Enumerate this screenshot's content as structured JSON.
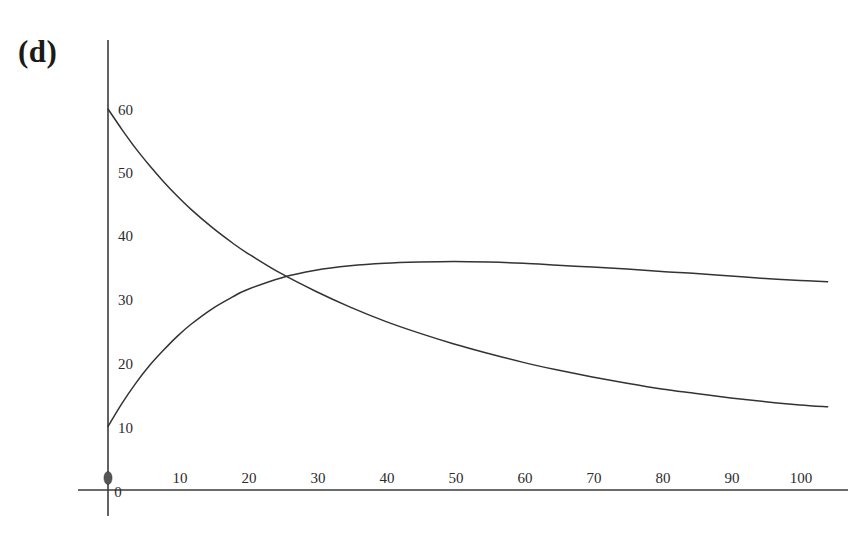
{
  "figure": {
    "panel_label": "(d)",
    "background_color": "#ffffff",
    "axis_color": "#3b3b3b",
    "curve_color": "#333333"
  },
  "chart_data": {
    "type": "line",
    "title": "",
    "subtitle": "",
    "xlabel": "",
    "ylabel": "",
    "panel_label": "(d)",
    "xlim": [
      0,
      104
    ],
    "ylim": [
      0,
      66
    ],
    "grid": false,
    "legend": null,
    "xticks": [
      0,
      10,
      20,
      30,
      40,
      50,
      60,
      70,
      80,
      90,
      100
    ],
    "xtick_labels": [
      "0",
      "10",
      "20",
      "30",
      "40",
      "50",
      "60",
      "70",
      "80",
      "90",
      "100"
    ],
    "yticks": [
      10,
      20,
      30,
      40,
      50,
      60
    ],
    "ytick_labels": [
      "10",
      "20",
      "30",
      "40",
      "50",
      "60"
    ],
    "origin_marker": true,
    "annotations": [
      {
        "text": "(d)",
        "x_px": 18,
        "y_px": 36
      }
    ],
    "series": [
      {
        "name": "decaying-curve",
        "x": [
          0,
          2,
          4,
          6,
          8,
          10,
          12,
          15,
          18,
          20,
          25,
          30,
          35,
          40,
          45,
          50,
          55,
          60,
          65,
          70,
          75,
          80,
          85,
          90,
          95,
          100,
          104
        ],
        "values": [
          60.0,
          56.8,
          53.8,
          51.1,
          48.6,
          46.3,
          44.2,
          41.4,
          38.9,
          37.4,
          34.1,
          31.3,
          28.8,
          26.6,
          24.7,
          23.0,
          21.5,
          20.1,
          18.9,
          17.8,
          16.8,
          15.9,
          15.2,
          14.5,
          13.9,
          13.4,
          13.1
        ]
      },
      {
        "name": "rising-saturating-curve",
        "x": [
          0,
          2,
          4,
          6,
          8,
          10,
          12,
          15,
          18,
          20,
          25,
          30,
          35,
          40,
          45,
          50,
          55,
          60,
          65,
          70,
          75,
          80,
          85,
          90,
          95,
          100,
          104
        ],
        "values": [
          10.0,
          13.6,
          16.8,
          19.6,
          22.0,
          24.2,
          26.1,
          28.5,
          30.4,
          31.5,
          33.4,
          34.6,
          35.3,
          35.7,
          35.9,
          36.0,
          35.9,
          35.7,
          35.4,
          35.1,
          34.8,
          34.4,
          34.1,
          33.7,
          33.3,
          33.0,
          32.8
        ]
      }
    ],
    "intersection": {
      "x": 25,
      "y": 33.5
    },
    "peak_of_rising": {
      "x": 50,
      "y": 36.0
    }
  }
}
